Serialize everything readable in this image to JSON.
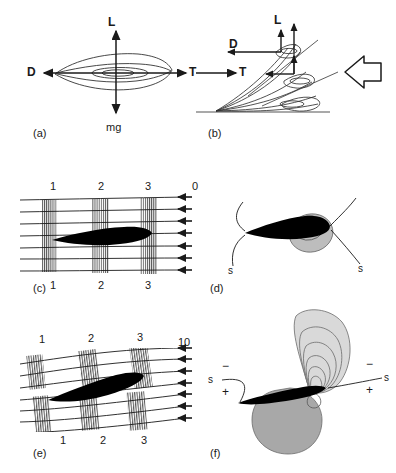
{
  "figure": {
    "background_color": "#ffffff",
    "ink_color": "#000000",
    "panel_count": 6
  },
  "panels": {
    "a": {
      "key": "(a)",
      "caption": "Steady gliding force balance on a flying animal",
      "vectors": [
        {
          "name": "lift",
          "label": "L",
          "direction": "up"
        },
        {
          "name": "drag",
          "label": "D",
          "direction": "left"
        },
        {
          "name": "thrust",
          "label": "T",
          "direction": "right"
        },
        {
          "name": "weight",
          "label": "mg",
          "direction": "down"
        }
      ]
    },
    "b": {
      "key": "(b)",
      "caption": "Take-off wing-stroke sequence with resultant forces and oncoming flow",
      "vectors": [
        {
          "name": "lift",
          "label": "L",
          "direction": "up"
        },
        {
          "name": "drag",
          "label": "D",
          "direction": "left"
        },
        {
          "name": "thrust",
          "label": "T",
          "direction": "right"
        }
      ],
      "flow_arrow": "large-hollow-arrow-left"
    },
    "c": {
      "key": "(c)",
      "caption": "Timeline flow visualisation at zero angle of attack",
      "timeline_labels_top": [
        "1",
        "2",
        "3"
      ],
      "timeline_labels_bottom": [
        "1",
        "2",
        "3"
      ],
      "angle_label": "0",
      "angle_units": "degrees",
      "streamline_count": 7,
      "flow_direction": "right-to-left"
    },
    "d": {
      "key": "(d)",
      "caption": "Bound circulation region and separating streamlines at zero incidence",
      "streamline_labels": [
        "s",
        "s"
      ],
      "circulation_shading": "gray-blob"
    },
    "e": {
      "key": "(e)",
      "caption": "Timeline flow visualisation at ten degrees angle of attack",
      "timeline_labels_top": [
        "1",
        "2",
        "3"
      ],
      "timeline_labels_bottom": [
        "1",
        "2",
        "3"
      ],
      "angle_label": "10",
      "angle_units": "degrees",
      "streamline_count": 7,
      "flow_direction": "right-to-left"
    },
    "f": {
      "key": "(f)",
      "caption": "Vorticity contours with positive and negative circulation lobes",
      "streamline_labels": [
        "s",
        "s"
      ],
      "sign_labels_left": [
        "−",
        "+"
      ],
      "sign_labels_right": [
        "−",
        "+"
      ],
      "contour_fill_upper": "#d9d9d9",
      "contour_fill_lower": "#a8a8a8"
    }
  },
  "colors": {
    "line": "#1a1a1a",
    "hatch": "#4d4d4d",
    "body_fill": "#000000",
    "light_gray": "#d9d9d9",
    "mid_gray": "#bdbdbd",
    "dark_gray": "#a8a8a8",
    "ground": "#8c8c8c"
  }
}
